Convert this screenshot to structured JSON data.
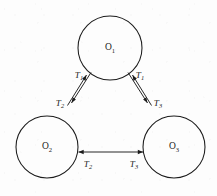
{
  "figure": {
    "type": "node-link-diagram",
    "background_color": "#fdfdfd",
    "stroke_color": "#1b1b1b"
  },
  "nodes": [
    {
      "id": "O1",
      "base": "O",
      "subscript": "1",
      "cx": 110,
      "cy": 48,
      "r": 32
    },
    {
      "id": "O2",
      "base": "O",
      "subscript": "2",
      "cx": 47,
      "cy": 147,
      "r": 31
    },
    {
      "id": "O3",
      "base": "O",
      "subscript": "3",
      "cx": 174,
      "cy": 147,
      "r": 31
    }
  ],
  "edges": [
    {
      "id": "edge-o2-o1",
      "from": "O2",
      "to": "O1",
      "direction": "up-right",
      "label_base": "T",
      "label_subscript": "1",
      "label_x": 79,
      "label_y": 76
    },
    {
      "id": "edge-o1-o2",
      "from": "O1",
      "to": "O2",
      "direction": "down-left",
      "label_base": "T",
      "label_subscript": "2",
      "label_x": 60,
      "label_y": 104
    },
    {
      "id": "edge-o3-o1",
      "from": "O3",
      "to": "O1",
      "direction": "up-left",
      "label_base": "T",
      "label_subscript": "1",
      "label_x": 140,
      "label_y": 76
    },
    {
      "id": "edge-o1-o3",
      "from": "O1",
      "to": "O3",
      "direction": "down-right",
      "label_base": "T",
      "label_subscript": "3",
      "label_x": 158,
      "label_y": 104
    },
    {
      "id": "edge-o3-o2",
      "from": "O3",
      "to": "O2",
      "direction": "left",
      "label_base": "T",
      "label_subscript": "2",
      "label_x": 88,
      "label_y": 165
    },
    {
      "id": "edge-o2-o3",
      "from": "O2",
      "to": "O3",
      "direction": "right",
      "label_base": "T",
      "label_subscript": "3",
      "label_x": 134,
      "label_y": 165
    }
  ]
}
